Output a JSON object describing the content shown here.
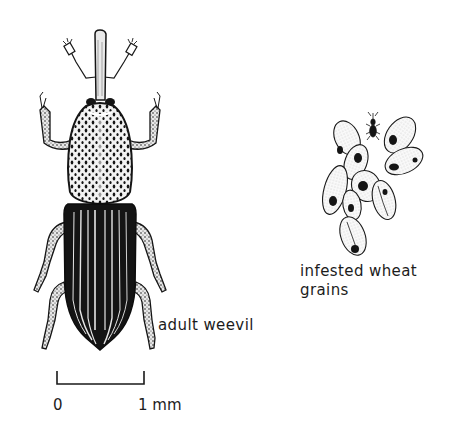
{
  "figure": {
    "subjects": [
      {
        "id": "adult-weevil",
        "label": "adult weevil"
      },
      {
        "id": "infested-grains",
        "label_lines": [
          "infested wheat",
          "grains"
        ]
      }
    ],
    "scale_bar": {
      "start_label": "0",
      "end_label": "1 mm",
      "unit": "mm",
      "length_value": 1
    },
    "colors": {
      "ink": "#141414",
      "background": "#ffffff"
    }
  }
}
